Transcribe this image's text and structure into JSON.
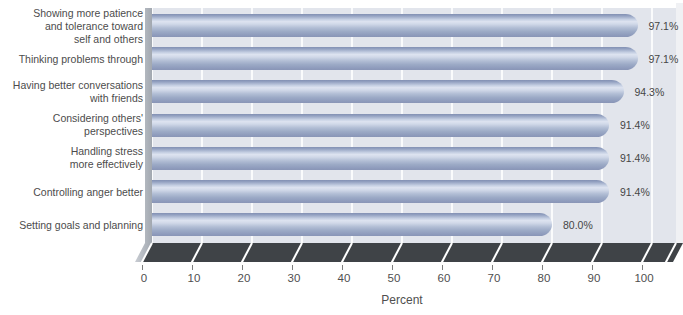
{
  "chart_data": {
    "type": "bar",
    "orientation": "horizontal",
    "title": "",
    "categories": [
      "Showing more patience\nand tolerance toward\nself and others",
      "Thinking problems through",
      "Having better conversations\nwith friends",
      "Considering others'\nperspectives",
      "Handling stress\nmore effectively",
      "Controlling anger better",
      "Setting goals and planning"
    ],
    "values": [
      97.1,
      97.1,
      94.3,
      91.4,
      91.4,
      91.4,
      80.0
    ],
    "value_labels": [
      "97.1%",
      "97.1%",
      "94.3%",
      "91.4%",
      "91.4%",
      "91.4%",
      "80.0%"
    ],
    "xlabel": "Percent",
    "xlim": [
      0,
      100
    ],
    "xticks": [
      0,
      10,
      20,
      30,
      40,
      50,
      60,
      70,
      80,
      90,
      100
    ],
    "grid": true,
    "legend": false,
    "colors": {
      "bar_edge": "#8290b3",
      "bar_highlight": "#dde3f0",
      "bar_bottom": "#8995b6",
      "plot_bg": "#e2e5ec",
      "right_wall": "#f0f1f4",
      "left_wall": "#aab0b8",
      "floor": "#3f4347",
      "gridline": "#ffffff",
      "category_text": "#4c4c4c",
      "tick_text": "#4f4f4f"
    }
  }
}
